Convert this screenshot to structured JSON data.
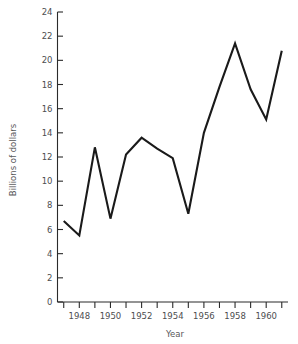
{
  "chart_data": {
    "type": "line",
    "title": "",
    "subtitle": "",
    "xlabel": "Year",
    "ylabel": "Billions of dollars",
    "xlim": [
      1946.6,
      1961.4
    ],
    "ylim": [
      0,
      24
    ],
    "grid": false,
    "legend": null,
    "legend_position": "none",
    "line_color": "#1a1a1a",
    "x": [
      1947,
      1948,
      1949,
      1950,
      1951,
      1952,
      1953,
      1954,
      1955,
      1956,
      1957,
      1958,
      1959,
      1960,
      1961
    ],
    "values": [
      6.7,
      5.5,
      12.8,
      6.9,
      12.2,
      13.6,
      12.7,
      11.9,
      7.3,
      14.0,
      17.8,
      21.4,
      17.6,
      15.1,
      20.8
    ],
    "series": [
      {
        "name": "Billions of dollars",
        "values": [
          6.7,
          5.5,
          12.8,
          6.9,
          12.2,
          13.6,
          12.7,
          11.9,
          7.3,
          14.0,
          17.8,
          21.4,
          17.6,
          15.1,
          20.8
        ]
      }
    ],
    "y_ticks": [
      0,
      2,
      4,
      6,
      8,
      10,
      12,
      14,
      16,
      18,
      20,
      22,
      24
    ],
    "y_tick_labels": [
      "0",
      "2",
      "4",
      "6",
      "8",
      "10",
      "12",
      "14",
      "16",
      "18",
      "20",
      "22",
      "24"
    ],
    "x_ticks": [
      1947,
      1948,
      1949,
      1950,
      1951,
      1952,
      1953,
      1954,
      1955,
      1956,
      1957,
      1958,
      1959,
      1960,
      1961
    ],
    "x_tick_labels": [
      "",
      "1948",
      "",
      "1950",
      "",
      "1952",
      "",
      "1954",
      "",
      "1956",
      "",
      "1958",
      "",
      "1960",
      ""
    ]
  }
}
